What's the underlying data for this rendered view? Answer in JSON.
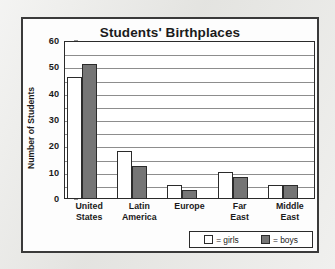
{
  "chart_data": {
    "type": "bar",
    "title": "Students' Birthplaces",
    "xlabel": "",
    "ylabel": "Number of Students",
    "ylim": [
      0,
      60
    ],
    "ytick_labels": [
      "60",
      "50",
      "40",
      "30",
      "20",
      "10",
      "0"
    ],
    "yticks": [
      60,
      50,
      40,
      30,
      20,
      10,
      0
    ],
    "grid": true,
    "grid_interval": 5,
    "legend_position": "bottom-right",
    "categories": [
      "United States",
      "Latin America",
      "Europe",
      "Far East",
      "Middle East"
    ],
    "category_lines": [
      [
        "United",
        "States"
      ],
      [
        "Latin",
        "America"
      ],
      [
        "Europe"
      ],
      [
        "Far",
        "East"
      ],
      [
        "Middle",
        "East"
      ]
    ],
    "series": [
      {
        "name": "girls",
        "legend_label": "= girls",
        "color": "#ffffff",
        "values": [
          46,
          18,
          5,
          10,
          5
        ]
      },
      {
        "name": "boys",
        "legend_label": "= boys",
        "color": "#757575",
        "values": [
          51,
          12,
          3,
          8,
          5
        ]
      }
    ]
  },
  "colors": {
    "page_background": "#e6e6e3",
    "figure_background": "#fdfdfd",
    "frame_border": "#3a3a3a",
    "axis": "#2b2b2b",
    "gridline": "#8d8d8d",
    "girls_fill": "#ffffff",
    "boys_fill": "#757575",
    "text": "#1b1b1b"
  }
}
